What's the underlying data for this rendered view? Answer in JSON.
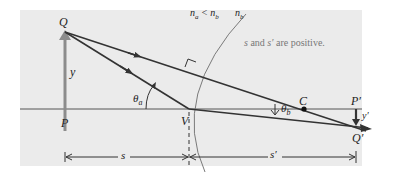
{
  "diagram": {
    "points": {
      "Q": "Q",
      "P": "P",
      "V": "V",
      "C": "C",
      "P_prime": "P′",
      "Q_prime": "Q′"
    },
    "labels": {
      "object_height": "y",
      "image_height": "y′",
      "theta_a": "θa",
      "theta_a_base": "θ",
      "theta_a_sub": "a",
      "theta_b_base": "θ",
      "theta_b_sub": "b",
      "object_distance": "s",
      "image_distance": "s′",
      "n_relation": "na < nb",
      "n_relation_left": "n",
      "n_relation_left_sub": "a",
      "n_relation_mid": " < n",
      "n_relation_mid_sub": "b",
      "n_b": "n",
      "n_b_sub": "b"
    },
    "note": {
      "s": "s",
      "and": " and ",
      "s_prime": "s′",
      "rest": " are positive."
    },
    "colors": {
      "panel": "#ebebeb",
      "ray": "#333333",
      "object_arrow": "#8c8c8c",
      "surface": "#7a7a7a",
      "text": "#222222",
      "note": "#777777"
    }
  }
}
